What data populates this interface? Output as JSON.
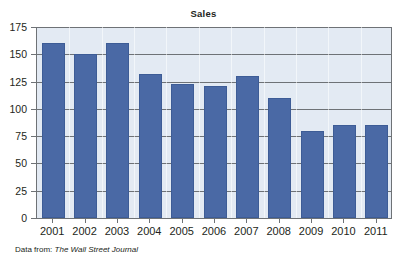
{
  "chart_data": {
    "type": "bar",
    "title": "Sales",
    "xlabel": "",
    "ylabel": "",
    "categories": [
      "2001",
      "2002",
      "2003",
      "2004",
      "2005",
      "2006",
      "2007",
      "2008",
      "2009",
      "2010",
      "2011"
    ],
    "values": [
      160,
      150,
      160,
      132,
      123,
      121,
      130,
      110,
      80,
      85,
      85
    ],
    "ylim": [
      0,
      175
    ],
    "yticks": [
      0,
      25,
      50,
      75,
      100,
      125,
      150,
      175
    ],
    "ytick_labels": [
      "0",
      "25",
      "50",
      "75",
      "100",
      "125",
      "150",
      "175"
    ],
    "grid": "horizontal",
    "legend": "none",
    "series": [
      {
        "name": "Sales",
        "values": [
          160,
          150,
          160,
          132,
          123,
          121,
          130,
          110,
          80,
          85,
          85
        ]
      }
    ],
    "colors": {
      "bar_fill": "#4a69a5",
      "bar_edge": "#3d5c96",
      "plot_background": "#e3eaf3",
      "gridline": "#6e7276",
      "axis": "#6e7276",
      "text": "#231f20",
      "figure_background": "#ffffff"
    }
  },
  "source_note": {
    "prefix": "Data from:",
    "publication": "The Wall Street Journal"
  }
}
